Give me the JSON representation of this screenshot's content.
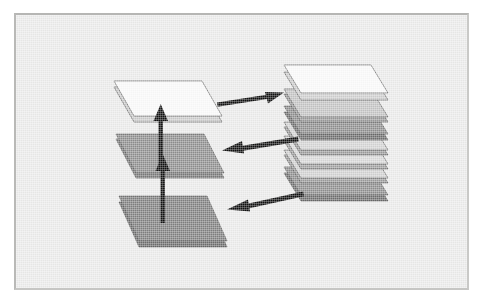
{
  "figure": {
    "kind": "diagram",
    "title_visible": false,
    "caption_visible": false,
    "background_color": "#ececeb",
    "frame_border_color": "#b8b8b6"
  },
  "palette": {
    "white_plane": "#fbfbfb",
    "white_plane_shade": "#dedede",
    "light_gray_plane": "#cfcfcf",
    "mid_gray_plane": "#8f8f8f",
    "dark_gray_plane": "#808080",
    "edge_stroke": "#5d5d5d",
    "arrow_color": "#111111",
    "panel_background": "#ececeb"
  },
  "left_group": {
    "name": "exploded-layers",
    "planes": [
      {
        "id": "left-plane-top",
        "label": "top plane",
        "fill": "#fbfbfb",
        "level": 1
      },
      {
        "id": "left-plane-middle",
        "label": "middle plane",
        "fill": "#8f8f8f",
        "level": 2
      },
      {
        "id": "left-plane-bottom",
        "label": "bottom plane",
        "fill": "#808080",
        "level": 3
      }
    ],
    "vertical_arrows": [
      {
        "id": "arrow-up-lower",
        "direction": "up",
        "from": "left-plane-bottom",
        "to": "left-plane-middle"
      },
      {
        "id": "arrow-up-upper",
        "direction": "up",
        "from": "left-plane-middle",
        "to": "left-plane-top"
      }
    ]
  },
  "right_group": {
    "name": "assembled-stack",
    "plane_count": 7,
    "planes": [
      {
        "id": "stack-plane-1",
        "label": "stack layer 1",
        "fill": "#fbfbfb",
        "index": 1
      },
      {
        "id": "stack-plane-2",
        "label": "stack layer 2",
        "fill": "#c4c4c4",
        "index": 2
      },
      {
        "id": "stack-plane-3",
        "label": "stack layer 3",
        "fill": "#8f8f8f",
        "index": 3
      },
      {
        "id": "stack-plane-4",
        "label": "stack layer 4",
        "fill": "#d4d4d4",
        "index": 4
      },
      {
        "id": "stack-plane-5",
        "label": "stack layer 5",
        "fill": "#d9d9d9",
        "index": 5
      },
      {
        "id": "stack-plane-6",
        "label": "stack layer 6",
        "fill": "#d2d2d2",
        "index": 6
      },
      {
        "id": "stack-plane-7",
        "label": "stack layer 7",
        "fill": "#8f8f8f",
        "index": 7
      }
    ]
  },
  "connector_arrows": [
    {
      "id": "arrow-right-top",
      "direction": "right",
      "from": "left-plane-top",
      "to": "stack-plane-1"
    },
    {
      "id": "arrow-left-middle",
      "direction": "left",
      "from": "stack-plane-3",
      "to": "left-plane-middle"
    },
    {
      "id": "arrow-left-bottom",
      "direction": "left",
      "from": "stack-plane-7",
      "to": "left-plane-bottom"
    }
  ]
}
